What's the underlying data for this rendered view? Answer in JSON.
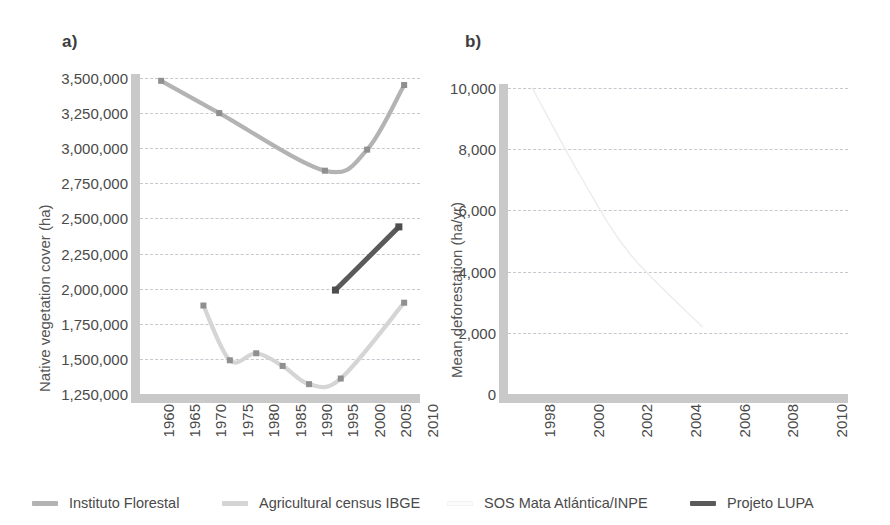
{
  "figure": {
    "background": "#ffffff",
    "panel_a_label": "a)",
    "panel_b_label": "b)"
  },
  "legend": {
    "position": "bottom",
    "items": [
      {
        "label": "Instituto Florestal",
        "color": "#b3b3b3"
      },
      {
        "label": "Agricultural census IBGE",
        "color": "#d5d5d5"
      },
      {
        "label": "SOS Mata Atlántica/INPE",
        "color": "#fbfbfb"
      },
      {
        "label": "Projeto LUPA",
        "color": "#5a5a5a"
      }
    ]
  },
  "chart_data": [
    {
      "type": "line",
      "panel": "a",
      "title": "a)",
      "xlabel": "",
      "ylabel": "Native vegetation cover (ha)",
      "xlim": [
        1958,
        2011
      ],
      "ylim": [
        1250000,
        3500000
      ],
      "xticks": [
        1960,
        1965,
        1970,
        1975,
        1980,
        1985,
        1990,
        1995,
        2000,
        2005,
        2010
      ],
      "yticks": [
        1250000,
        1500000,
        1750000,
        2000000,
        2250000,
        2500000,
        2750000,
        3000000,
        3250000,
        3500000
      ],
      "ytick_labels": [
        "1,250,000",
        "1,500,000",
        "1,750,000",
        "2,000,000",
        "2,250,000",
        "2,500,000",
        "2,750,000",
        "3,000,000",
        "3,250,000",
        "3,500,000"
      ],
      "xtick_labels": [
        "1960",
        "1965",
        "1970",
        "1975",
        "1980",
        "1985",
        "1990",
        "1995",
        "2000",
        "2005",
        "2010"
      ],
      "grid": true,
      "legend_position": "figure-bottom",
      "series": [
        {
          "name": "Instituto Florestal",
          "color": "#b3b3b3",
          "marker": "square",
          "x": [
            1962,
            1973,
            1993,
            2001,
            2008
          ],
          "values": [
            3480000,
            3250000,
            2840000,
            2990000,
            3450000
          ]
        },
        {
          "name": "Agricultural census IBGE",
          "color": "#d5d5d5",
          "marker": "square",
          "x": [
            1970,
            1975,
            1980,
            1985,
            1990,
            1996,
            2008
          ],
          "values": [
            1880000,
            1490000,
            1540000,
            1450000,
            1320000,
            1360000,
            1900000
          ]
        },
        {
          "name": "Projeto LUPA",
          "color": "#5a5a5a",
          "marker": "square",
          "x": [
            1995,
            2007
          ],
          "values": [
            1990000,
            2440000
          ]
        }
      ]
    },
    {
      "type": "line",
      "panel": "b",
      "title": "b)",
      "xlabel": "",
      "ylabel": "Mean deforestation (ha/yr)",
      "xlim": [
        1997,
        2011
      ],
      "ylim": [
        0,
        10000
      ],
      "xticks": [
        1998,
        2000,
        2002,
        2004,
        2006,
        2008,
        2010
      ],
      "yticks": [
        0,
        2000,
        4000,
        6000,
        8000,
        10000
      ],
      "ytick_labels": [
        "0",
        "2,000",
        "4,000",
        "6,000",
        "8,000",
        "10,000"
      ],
      "xtick_labels": [
        "1998",
        "2000",
        "2002",
        "2004",
        "2006",
        "2008",
        "2010"
      ],
      "grid": true,
      "legend_position": "figure-bottom",
      "series": [
        {
          "name": "SOS Mata Atlántica/INPE",
          "color": "#ededed",
          "marker": "none",
          "x": [
            1998,
            2000,
            2002,
            2005
          ],
          "values": [
            10000,
            7100,
            4600,
            2200
          ]
        }
      ]
    }
  ]
}
